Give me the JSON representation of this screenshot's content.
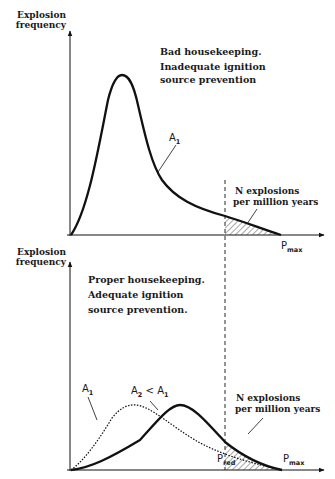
{
  "top_panel": {
    "y_label_line1": "Explosion",
    "y_label_line2": "frequency",
    "desc_line1": "Bad housekeeping.",
    "desc_line2": "Inadequate ignition",
    "desc_line3": "source prevention",
    "curve_label": "A",
    "curve_label_sub": "1",
    "tail_line1": "N explosions",
    "tail_line2": "per million years",
    "x_label": "P",
    "x_label_sub": "max"
  },
  "bottom_panel": {
    "y_label_line1": "Explosion",
    "y_label_line2": "frequency",
    "desc_line1": "Proper housekeeping.",
    "desc_line2": "Adequate ignition",
    "desc_line3": "source prevention.",
    "dotted_label": "A",
    "dotted_label_sub": "1",
    "solid_label_a": "A",
    "solid_label_a_sub": "2",
    "solid_label_lt": " < ",
    "solid_label_b": "A",
    "solid_label_b_sub": "1",
    "tail_line1": "N explosions",
    "tail_line2": "per million years",
    "x_label_red": "P",
    "x_label_red_sub": "red",
    "x_label_max": "P",
    "x_label_max_sub": "max"
  },
  "colors": {
    "ink": "#111111",
    "background": "#ffffff"
  }
}
